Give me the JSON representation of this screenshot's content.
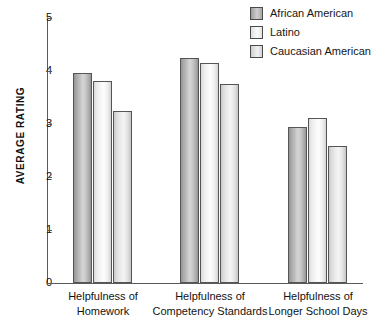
{
  "chart_data": {
    "type": "bar",
    "title": "",
    "xlabel": "",
    "ylabel": "AVERAGE RATING",
    "ylim": [
      0,
      5
    ],
    "yticks": [
      "0",
      "1",
      "2",
      "3",
      "4",
      "5"
    ],
    "grid": false,
    "legend_position": "top-right",
    "categories": [
      "Helpfulness of Homework",
      "Helpfulness of Competency Standards",
      "Helpfulness of Longer School Days"
    ],
    "category_lines": [
      [
        "Helpfulness of",
        "Homework"
      ],
      [
        "Helpfulness of",
        "Competency Standards"
      ],
      [
        "Helpfulness of",
        "Longer School Days"
      ]
    ],
    "series": [
      {
        "name": "African American",
        "values": [
          3.96,
          4.25,
          2.95
        ]
      },
      {
        "name": "Latino",
        "values": [
          3.82,
          4.15,
          3.11
        ]
      },
      {
        "name": "Caucasian American",
        "values": [
          3.24,
          3.75,
          2.59
        ]
      }
    ],
    "colors": {
      "african_american": "#b5b5b5",
      "latino": "#f5f5f5",
      "caucasian_american": "#e4e4e4",
      "bar_outline": "#555555",
      "axis": "#5a5a5a",
      "text": "#111111",
      "background": "#ffffff"
    }
  },
  "legend": {
    "items": [
      {
        "label": "African American"
      },
      {
        "label": "Latino"
      },
      {
        "label": "Caucasian American"
      }
    ]
  },
  "axis": {
    "y_title": "AVERAGE RATING",
    "y_ticks": [
      "5",
      "4",
      "3",
      "2",
      "1",
      "0"
    ]
  }
}
